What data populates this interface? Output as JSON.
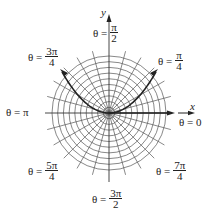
{
  "diagram": {
    "type": "polar-grid",
    "center": {
      "x": 109,
      "y": 113
    },
    "circle_count": 10,
    "max_radius": 57,
    "spoke_step_degrees": 15,
    "axes": {
      "x_label": "x",
      "y_label": "y"
    },
    "curve": {
      "description": "parabola-shaped curve through origin",
      "from_direction": "3π/4",
      "to_direction": "π/4",
      "color": "#222222"
    },
    "angle_labels": [
      {
        "id": "pi-over-2",
        "prefix": "θ =",
        "num": "π",
        "den": "2"
      },
      {
        "id": "3pi-over-4",
        "prefix": "θ =",
        "num": "3π",
        "den": "4"
      },
      {
        "id": "pi-over-4",
        "prefix": "θ =",
        "num": "π",
        "den": "4"
      },
      {
        "id": "pi",
        "text": "θ = π"
      },
      {
        "id": "zero",
        "text": "θ = 0"
      },
      {
        "id": "5pi-over-4",
        "prefix": "θ =",
        "num": "5π",
        "den": "4"
      },
      {
        "id": "7pi-over-4",
        "prefix": "θ =",
        "num": "7π",
        "den": "4"
      },
      {
        "id": "3pi-over-2",
        "prefix": "θ =",
        "num": "3π",
        "den": "2"
      }
    ]
  }
}
